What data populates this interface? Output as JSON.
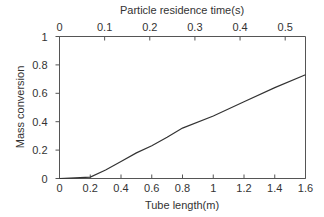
{
  "chart_data": {
    "type": "line",
    "title": "",
    "xlabel": "Tube length(m)",
    "ylabel": "Mass conversion",
    "x2label": "Particle residence time(s)",
    "xlim": [
      0,
      1.6
    ],
    "ylim": [
      0,
      1
    ],
    "x2lim": [
      0,
      0.545
    ],
    "xticks": [
      "0",
      "0.2",
      "0.4",
      "0.6",
      "0.8",
      "1",
      "1.2",
      "1.4",
      "1.6"
    ],
    "yticks": [
      "0",
      "0.2",
      "0.4",
      "0.6",
      "0.8",
      "1"
    ],
    "x2ticks": [
      "0",
      "0.1",
      "0.2",
      "0.3",
      "0.4",
      "0.5"
    ],
    "grid": false,
    "legend": null,
    "series": [
      {
        "name": "Mass conversion",
        "x": [
          0,
          0.1,
          0.2,
          0.3,
          0.4,
          0.5,
          0.6,
          0.7,
          0.8,
          1.0,
          1.2,
          1.4,
          1.6
        ],
        "values": [
          0,
          0.005,
          0.01,
          0.06,
          0.12,
          0.18,
          0.23,
          0.29,
          0.355,
          0.44,
          0.54,
          0.64,
          0.73
        ]
      }
    ],
    "color": "#333333"
  }
}
